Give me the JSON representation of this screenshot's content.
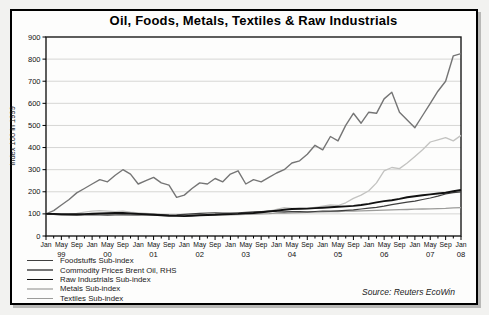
{
  "title": "Oil, Foods, Metals, Textiles & Raw Industrials",
  "source": "Source: Reuters EcoWin",
  "chart_data": {
    "type": "line",
    "title": "Oil, Foods, Metals, Textiles & Raw Industrials",
    "ylabel": "Index 100 in 1999",
    "ylim": [
      0,
      900
    ],
    "ytick_step": 100,
    "grid": true,
    "gridline_color": "#d6d6d4",
    "legend_position": "bottom-left",
    "x_axis": {
      "description": "Monthly, Jan 1999 to Jan 2008; samples every 2 months",
      "month_label_cycle": [
        "Jan",
        "May",
        "Sep"
      ],
      "years": [
        "99",
        "00",
        "01",
        "02",
        "03",
        "04",
        "05",
        "06",
        "07",
        "08"
      ],
      "last_month_label": "Jan"
    },
    "x_step_months": 2,
    "series": [
      {
        "name": "Foodstuffs Sub-index",
        "color": "#3f3f3f",
        "stroke_width": 1.2,
        "values": [
          100,
          98,
          96,
          95,
          94,
          95,
          97,
          96,
          94,
          95,
          96,
          95,
          96,
          97,
          98,
          97,
          95,
          96,
          98,
          100,
          102,
          104,
          105,
          104,
          103,
          105,
          107,
          109,
          111,
          112,
          110,
          109,
          111,
          110,
          109,
          111,
          113,
          112,
          114,
          116,
          118,
          122,
          126,
          130,
          135,
          142,
          148,
          153,
          158,
          165,
          172,
          180,
          190,
          196,
          200
        ]
      },
      {
        "name": "Commodity Prices Brent Oil, RHS",
        "color": "#757575",
        "stroke_width": 1.4,
        "values": [
          100,
          115,
          140,
          165,
          195,
          215,
          235,
          255,
          245,
          275,
          300,
          280,
          235,
          250,
          265,
          240,
          230,
          175,
          185,
          215,
          240,
          235,
          260,
          245,
          280,
          295,
          235,
          255,
          245,
          265,
          285,
          300,
          330,
          340,
          370,
          410,
          390,
          450,
          430,
          500,
          555,
          510,
          560,
          555,
          620,
          650,
          560,
          525,
          490,
          545,
          600,
          655,
          700,
          815,
          825
        ]
      },
      {
        "name": "Raw Industrials Sub-index",
        "color": "#111111",
        "stroke_width": 1.9,
        "values": [
          100,
          100,
          99,
          98,
          98,
          99,
          101,
          102,
          103,
          104,
          104,
          102,
          100,
          98,
          96,
          94,
          92,
          91,
          90,
          92,
          94,
          95,
          96,
          98,
          99,
          100,
          102,
          104,
          107,
          111,
          115,
          119,
          122,
          123,
          124,
          126,
          128,
          130,
          132,
          134,
          136,
          140,
          145,
          152,
          158,
          162,
          168,
          175,
          180,
          184,
          188,
          192,
          196,
          202,
          208
        ]
      },
      {
        "name": "Metals Sub-index",
        "color": "#c3c3c1",
        "stroke_width": 1.3,
        "values": [
          100,
          98,
          96,
          98,
          102,
          108,
          112,
          115,
          112,
          110,
          112,
          108,
          105,
          102,
          100,
          98,
          95,
          93,
          95,
          98,
          100,
          97,
          95,
          97,
          100,
          98,
          100,
          103,
          107,
          112,
          120,
          128,
          125,
          122,
          125,
          130,
          135,
          140,
          138,
          150,
          170,
          185,
          205,
          240,
          295,
          310,
          305,
          330,
          360,
          390,
          425,
          435,
          445,
          430,
          455
        ]
      },
      {
        "name": "Textiles Sub-index",
        "color": "#9c9c9a",
        "stroke_width": 1.3,
        "values": [
          100,
          99,
          98,
          97,
          97,
          98,
          99,
          100,
          99,
          98,
          98,
          97,
          96,
          95,
          94,
          93,
          92,
          91,
          92,
          93,
          94,
          94,
          95,
          95,
          96,
          97,
          98,
          99,
          100,
          101,
          103,
          104,
          105,
          106,
          107,
          108,
          109,
          110,
          111,
          112,
          113,
          114,
          115,
          116,
          117,
          118,
          119,
          120,
          121,
          122,
          123,
          124,
          125,
          127,
          128
        ]
      }
    ]
  }
}
